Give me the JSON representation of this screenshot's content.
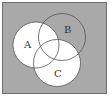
{
  "diagram": {
    "type": "venn-diagram",
    "universe": {
      "label": "",
      "fill": "#a9a9a9",
      "stroke": "#6e6e6e"
    },
    "sets": [
      {
        "id": "A",
        "label": "A",
        "fill": "#ffffff",
        "stroke": "#555555"
      },
      {
        "id": "B",
        "label": "B",
        "fill": "none",
        "stroke": "#555555"
      },
      {
        "id": "C",
        "label": "C",
        "fill": "#ffffff",
        "stroke": "#555555"
      }
    ],
    "shaded_regions": [
      "A",
      "C"
    ],
    "unshaded_regions": [
      "B only",
      "outside"
    ]
  }
}
